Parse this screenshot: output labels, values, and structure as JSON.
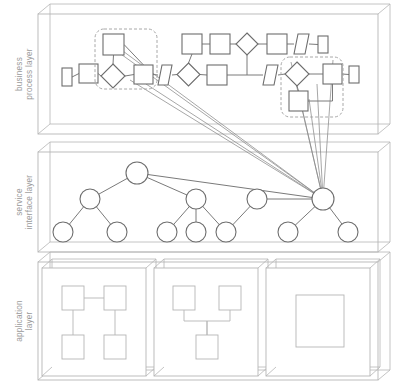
{
  "diagram": {
    "type": "layered-architecture",
    "canvas": {
      "width": 393,
      "height": 392
    },
    "colors": {
      "layer_box_stroke": "#b5b5b5",
      "node_stroke": "#6d6d6d",
      "node_fill": "#ffffff",
      "connector_stroke": "#7a7a7a",
      "cross_layer_stroke": "#8a8a8a",
      "highlight_dashed_stroke": "#a8a8a8",
      "label_text": "#9a9a9a",
      "background": "#ffffff"
    },
    "layers": [
      {
        "id": "business-process-layer",
        "label_lines": [
          "business",
          "process layer"
        ],
        "label_text": "business process layer",
        "box": {
          "x": 38,
          "y": 14,
          "w": 340,
          "h": 120
        },
        "depth": {
          "dx": 12,
          "dy": -10
        },
        "element_count": 22,
        "highlight_groups": 2
      },
      {
        "id": "service-interface-layer",
        "label_lines": [
          "service",
          "interface layer"
        ],
        "label_text": "service interface layer",
        "box": {
          "x": 38,
          "y": 152,
          "w": 340,
          "h": 100
        },
        "depth": {
          "dx": 12,
          "dy": -10
        },
        "element_count": 14,
        "tree_roots": 1
      },
      {
        "id": "application-layer",
        "label_lines": [
          "application",
          "layer"
        ],
        "label_text": "application layer",
        "box": {
          "x": 38,
          "y": 262,
          "w": 340,
          "h": 118
        },
        "depth": {
          "dx": 12,
          "dy": -10
        },
        "sub_boxes": 3
      }
    ],
    "business_process": {
      "nodes": [
        {
          "id": "bp-start",
          "shape": "rect",
          "x": 62,
          "y": 68,
          "w": 10,
          "h": 18
        },
        {
          "id": "bp-task-1",
          "shape": "rect",
          "x": 79,
          "y": 64,
          "w": 19,
          "h": 19
        },
        {
          "id": "bp-task-2",
          "shape": "rect",
          "x": 103,
          "y": 34,
          "w": 21,
          "h": 21
        },
        {
          "id": "bp-gateway-1",
          "shape": "diamond",
          "x": 101,
          "y": 64,
          "w": 24,
          "h": 24
        },
        {
          "id": "bp-task-3",
          "shape": "rect",
          "x": 134,
          "y": 65,
          "w": 19,
          "h": 19
        },
        {
          "id": "bp-para-1",
          "shape": "parallelogram",
          "x": 158,
          "y": 65,
          "w": 14,
          "h": 20
        },
        {
          "id": "bp-gateway-2",
          "shape": "diamond",
          "x": 177,
          "y": 63,
          "w": 23,
          "h": 23
        },
        {
          "id": "bp-task-4",
          "shape": "rect",
          "x": 182,
          "y": 34,
          "w": 20,
          "h": 20
        },
        {
          "id": "bp-task-5",
          "shape": "rect",
          "x": 210,
          "y": 34,
          "w": 20,
          "h": 20
        },
        {
          "id": "bp-gateway-3",
          "shape": "diamond",
          "x": 236,
          "y": 33,
          "w": 22,
          "h": 22
        },
        {
          "id": "bp-task-6",
          "shape": "rect",
          "x": 267,
          "y": 34,
          "w": 20,
          "h": 20
        },
        {
          "id": "bp-para-2",
          "shape": "parallelogram",
          "x": 294,
          "y": 34,
          "w": 15,
          "h": 20
        },
        {
          "id": "bp-end-1",
          "shape": "rect",
          "x": 318,
          "y": 36,
          "w": 10,
          "h": 17
        },
        {
          "id": "bp-task-7",
          "shape": "rect",
          "x": 207,
          "y": 65,
          "w": 20,
          "h": 20
        },
        {
          "id": "bp-para-3",
          "shape": "parallelogram",
          "x": 263,
          "y": 65,
          "w": 15,
          "h": 20
        },
        {
          "id": "bp-gateway-4",
          "shape": "diamond",
          "x": 285,
          "y": 62,
          "w": 24,
          "h": 24
        },
        {
          "id": "bp-task-8",
          "shape": "rect",
          "x": 289,
          "y": 91,
          "w": 19,
          "h": 20
        },
        {
          "id": "bp-task-9",
          "shape": "rect",
          "x": 323,
          "y": 64,
          "w": 19,
          "h": 20
        },
        {
          "id": "bp-end-2",
          "shape": "rect",
          "x": 349,
          "y": 66,
          "w": 10,
          "h": 17
        }
      ],
      "highlight_groups": [
        {
          "id": "bp-highlight-left",
          "x": 95,
          "y": 29,
          "w": 62,
          "h": 60
        },
        {
          "id": "bp-highlight-right",
          "x": 281,
          "y": 57,
          "w": 62,
          "h": 60
        }
      ]
    },
    "service_interface": {
      "nodes": [
        {
          "id": "svc-root",
          "level": 1,
          "cx": 137,
          "cy": 173,
          "r": 11
        },
        {
          "id": "svc-mid-1",
          "level": 2,
          "cx": 90,
          "cy": 199,
          "r": 10
        },
        {
          "id": "svc-mid-2",
          "level": 2,
          "cx": 196,
          "cy": 199,
          "r": 10
        },
        {
          "id": "svc-mid-3",
          "level": 2,
          "cx": 257,
          "cy": 199,
          "r": 10
        },
        {
          "id": "svc-mid-4",
          "level": 2,
          "cx": 323,
          "cy": 199,
          "r": 11
        },
        {
          "id": "svc-leaf-1",
          "level": 3,
          "cx": 63,
          "cy": 232,
          "r": 10
        },
        {
          "id": "svc-leaf-2",
          "level": 3,
          "cx": 117,
          "cy": 232,
          "r": 10
        },
        {
          "id": "svc-leaf-3",
          "level": 3,
          "cx": 167,
          "cy": 232,
          "r": 10
        },
        {
          "id": "svc-leaf-4",
          "level": 3,
          "cx": 196,
          "cy": 232,
          "r": 10
        },
        {
          "id": "svc-leaf-5",
          "level": 3,
          "cx": 226,
          "cy": 232,
          "r": 10
        },
        {
          "id": "svc-leaf-6",
          "level": 3,
          "cx": 288,
          "cy": 232,
          "r": 10
        },
        {
          "id": "svc-leaf-7",
          "level": 3,
          "cx": 348,
          "cy": 232,
          "r": 10
        }
      ],
      "edges": [
        [
          "svc-root",
          "svc-mid-1"
        ],
        [
          "svc-root",
          "svc-mid-2"
        ],
        [
          "svc-root",
          "svc-mid-4"
        ],
        [
          "svc-mid-1",
          "svc-leaf-1"
        ],
        [
          "svc-mid-1",
          "svc-leaf-2"
        ],
        [
          "svc-mid-2",
          "svc-leaf-3"
        ],
        [
          "svc-mid-2",
          "svc-leaf-4"
        ],
        [
          "svc-mid-2",
          "svc-leaf-5"
        ],
        [
          "svc-mid-3",
          "svc-leaf-5"
        ],
        [
          "svc-mid-3",
          "svc-mid-4"
        ],
        [
          "svc-mid-4",
          "svc-leaf-6"
        ],
        [
          "svc-mid-4",
          "svc-leaf-7"
        ]
      ]
    },
    "application": {
      "sub_boxes": [
        {
          "id": "app-box-1",
          "x": 42,
          "y": 268,
          "w": 104,
          "h": 108,
          "components": [
            {
              "id": "app1-comp-a",
              "x": 62,
              "y": 286,
              "w": 22,
              "h": 24
            },
            {
              "id": "app1-comp-b",
              "x": 104,
              "y": 286,
              "w": 22,
              "h": 24
            },
            {
              "id": "app1-comp-c",
              "x": 62,
              "y": 335,
              "w": 22,
              "h": 24
            },
            {
              "id": "app1-comp-d",
              "x": 104,
              "y": 335,
              "w": 22,
              "h": 24
            }
          ],
          "connections": [
            [
              "app1-comp-a",
              "app1-comp-b"
            ],
            [
              "app1-comp-a",
              "app1-comp-c"
            ],
            [
              "app1-comp-b",
              "app1-comp-d"
            ]
          ]
        },
        {
          "id": "app-box-2",
          "x": 154,
          "y": 268,
          "w": 104,
          "h": 108,
          "components": [
            {
              "id": "app2-comp-a",
              "x": 173,
              "y": 286,
              "w": 22,
              "h": 24
            },
            {
              "id": "app2-comp-b",
              "x": 219,
              "y": 286,
              "w": 22,
              "h": 24
            },
            {
              "id": "app2-comp-c",
              "x": 196,
              "y": 335,
              "w": 22,
              "h": 24
            }
          ],
          "connections": [
            [
              "app2-comp-a",
              "app2-comp-c"
            ],
            [
              "app2-comp-b",
              "app2-comp-c"
            ]
          ]
        },
        {
          "id": "app-box-3",
          "x": 266,
          "y": 268,
          "w": 104,
          "h": 108,
          "components": [
            {
              "id": "app3-comp-a",
              "x": 296,
              "y": 295,
              "w": 48,
              "h": 52
            }
          ],
          "connections": []
        }
      ]
    },
    "cross_layer_links": {
      "description": "Lines from business process layer highlight groups down to the rightmost service interface node",
      "target_node": "svc-mid-4",
      "count": 9
    }
  }
}
